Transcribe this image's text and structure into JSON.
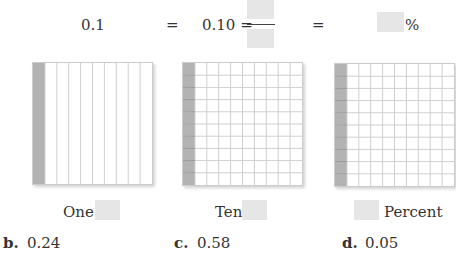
{
  "equation": {
    "decimal": "0.1",
    "eq1": "=",
    "hundredths": "0.10 =",
    "eq2": "=",
    "percent_sign": "%"
  },
  "grids": [
    {
      "label": "One",
      "columns": 10,
      "rows": 1,
      "shaded_columns": 1
    },
    {
      "label": "Ten",
      "columns": 10,
      "rows": 10,
      "shaded_columns": 1
    },
    {
      "label": "Percent",
      "columns": 10,
      "rows": 10,
      "shaded_columns": 1
    }
  ],
  "exercises": [
    {
      "letter": "b.",
      "value": "0.24"
    },
    {
      "letter": "c.",
      "value": "0.58"
    },
    {
      "letter": "d.",
      "value": "0.05"
    }
  ],
  "colors": {
    "shade": "#b3b3b3",
    "blank": "#e6e6e6",
    "gridline": "#cfcfcf"
  }
}
